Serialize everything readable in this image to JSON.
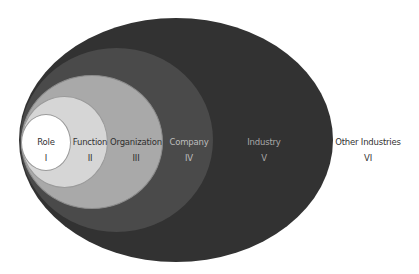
{
  "diagram": {
    "type": "nested-ellipses",
    "layers": [
      {
        "level": "I",
        "name": "Role",
        "fill": "#ffffff",
        "text_color": "#333333"
      },
      {
        "level": "II",
        "name": "Function",
        "fill": "#d6d6d6",
        "text_color": "#333333"
      },
      {
        "level": "III",
        "name": "Organization",
        "fill": "#a9a9a9",
        "text_color": "#2e2e2e"
      },
      {
        "level": "IV",
        "name": "Company",
        "fill": "#4a4a4a",
        "text_color": "#bdbdbd"
      },
      {
        "level": "V",
        "name": "Industry",
        "fill": "#323232",
        "text_color": "#a8a8a8"
      },
      {
        "level": "VI",
        "name": "Other Industries",
        "fill": "#ffffff",
        "text_color": "#333333"
      }
    ]
  }
}
